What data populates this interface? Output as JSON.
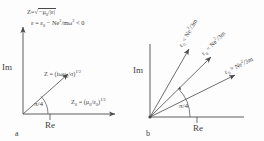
{
  "figure": {
    "type": "two-panel complex-plane phasor diagram",
    "background": "#fdfdfd",
    "line_color": "#4a4a4a",
    "text_color": "#3f3f3f"
  },
  "panel_a": {
    "label": "a",
    "axis_imag": "Im",
    "axis_real": "Re",
    "angle_label": "π/4",
    "top_note_line1_lhs": "Z",
    "top_note_line1_eq": "=",
    "top_note_line1_radicand": "−μ",
    "top_note_line1_radicand_sub": "0",
    "top_note_line1_radicand_rest": "/|ε|",
    "top_note_line2": "ε = ε",
    "top_note_line2_sub": "0",
    "top_note_line2_rest": " − Ne",
    "top_note_line2_sup": "2",
    "top_note_line2_rest2": "/mω",
    "top_note_line2_sup2": "2",
    "top_note_line2_tail": " < 0",
    "vector_label_lhs": "Z",
    "vector_label_body": " = (iωμ",
    "vector_label_sub": "0",
    "vector_label_body2": "/σ)",
    "vector_label_sup": "1/2",
    "axis_right_label_lhs": "Z",
    "axis_right_label_sub": "0",
    "axis_right_label_body": " = (μ",
    "axis_right_label_sub2": "0",
    "axis_right_label_body2": "/ε",
    "axis_right_label_sub3": "0",
    "axis_right_label_body3": ")",
    "axis_right_label_sup": "1/2"
  },
  "panel_b": {
    "label": "b",
    "axis_imag": "Im",
    "axis_real": "Re",
    "angle_label": "π/4",
    "vectors": [
      {
        "name": "upper-vector",
        "lhs": "ε",
        "lhs_sub": "0",
        "op": " < ",
        "rhs": "Ne",
        "rhs_sup": "2",
        "rhs_tail": "/3m",
        "angle_deg": 63
      },
      {
        "name": "middle-vector",
        "lhs": "ε",
        "lhs_sub": "0",
        "op": " = ",
        "rhs": "Ne",
        "rhs_sup": "2",
        "rhs_tail": "/3m",
        "angle_deg": 46
      },
      {
        "name": "lower-vector",
        "lhs": "ε",
        "lhs_sub": "0",
        "op": " > ",
        "rhs": "Ne",
        "rhs_sup": "2",
        "rhs_tail": "/3m",
        "angle_deg": 26
      }
    ]
  }
}
